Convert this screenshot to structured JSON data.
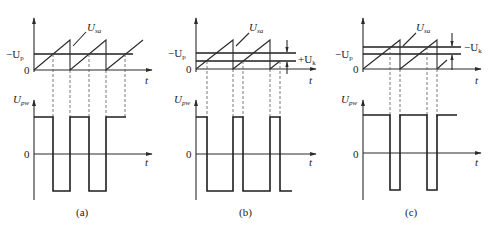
{
  "figure": {
    "panels": [
      {
        "id": "a",
        "caption": "(a)",
        "top_plot": {
          "y_labels": {
            "ref": "−U",
            "ref_sub": "p",
            "zero": "0"
          },
          "x_label": "t",
          "signal_label": "U",
          "signal_label_sub": "sa",
          "threshold_shift": null
        },
        "bottom_plot": {
          "y_label": "U",
          "y_label_sub": "pw",
          "zero": "0",
          "x_label": "t",
          "pulse_description": "square wave ~50% duty"
        }
      },
      {
        "id": "b",
        "caption": "(b)",
        "top_plot": {
          "y_labels": {
            "ref": "−U",
            "ref_sub": "p",
            "zero": "0"
          },
          "x_label": "t",
          "signal_label": "U",
          "signal_label_sub": "sa",
          "threshold_shift": {
            "label": "+U",
            "label_sub": "k",
            "direction": "down"
          }
        },
        "bottom_plot": {
          "y_label": "U",
          "y_label_sub": "pw",
          "zero": "0",
          "x_label": "t",
          "pulse_description": "narrow positive pulses (low level widened)"
        }
      },
      {
        "id": "c",
        "caption": "(c)",
        "top_plot": {
          "y_labels": {
            "ref": "−U",
            "ref_sub": "p",
            "zero": "0"
          },
          "x_label": "t",
          "signal_label": "U",
          "signal_label_sub": "sa",
          "threshold_shift": {
            "label": "−U",
            "label_sub": "k",
            "direction": "up"
          }
        },
        "bottom_plot": {
          "y_label": "U",
          "y_label_sub": "pw",
          "zero": "0",
          "x_label": "t",
          "pulse_description": "narrow negative pulses (high level widened)"
        }
      }
    ]
  }
}
